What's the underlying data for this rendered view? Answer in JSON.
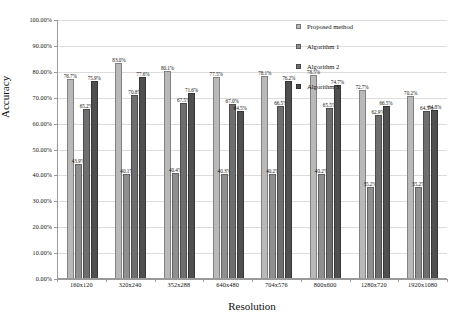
{
  "chart_data": {
    "type": "bar",
    "title": "",
    "xlabel": "Resolution",
    "ylabel": "Accuracy",
    "ylim": [
      0,
      100
    ],
    "ytick_labels": [
      "0.00%",
      "10.00%",
      "20.00%",
      "30.00%",
      "40.00%",
      "50.00%",
      "60.00%",
      "70.00%",
      "80.00%",
      "90.00%",
      "100.00%"
    ],
    "ytick_values": [
      0,
      10,
      20,
      30,
      40,
      50,
      60,
      70,
      80,
      90,
      100
    ],
    "grid": true,
    "legend_position": "top-right",
    "categories": [
      "160x120",
      "320x240",
      "352x288",
      "640x480",
      "704x576",
      "800x600",
      "1280x720",
      "1920x1080"
    ],
    "series": [
      {
        "name": "Proposed method",
        "color": "#b9b9b9",
        "values": [
          76.7,
          83.0,
          80.1,
          77.5,
          78.1,
          78.5,
          72.7,
          70.2
        ],
        "labels": [
          "76.7%",
          "83.0%",
          "80.1%",
          "77.5%",
          "78.1%",
          "78.5%",
          "72.7%",
          "70.2%"
        ]
      },
      {
        "name": "Algorithm 1",
        "color": "#8f8f8f",
        "values": [
          43.9,
          40.1,
          40.4,
          40.3,
          40.2,
          40.2,
          35.2,
          35.2
        ],
        "labels": [
          "43.9%",
          "40.1%",
          "40.4%",
          "40.3%",
          "40.2%",
          "40.2%",
          "35.2%",
          "35.2%"
        ]
      },
      {
        "name": "Algorithm 2",
        "color": "#6e6e6e",
        "values": [
          65.2,
          70.8,
          67.5,
          67.0,
          66.5,
          65.5,
          62.9,
          64.5
        ],
        "labels": [
          "65.2%",
          "70.8%",
          "67.5%",
          "67.0%",
          "66.5%",
          "65.5%",
          "62.9%",
          "64.5%"
        ]
      },
      {
        "name": "Algorithm 3",
        "color": "#4f4f4f",
        "values": [
          75.9,
          77.6,
          71.6,
          64.5,
          76.2,
          74.7,
          66.5,
          64.8
        ],
        "labels": [
          "75.9%",
          "77.6%",
          "71.6%",
          "64.5%",
          "76.2%",
          "74.7%",
          "66.5%",
          "64.8%"
        ]
      }
    ]
  },
  "axes": {
    "y_title": "Accuracy",
    "x_title": "Resolution"
  },
  "legend": {
    "items": [
      {
        "label": "Proposed method"
      },
      {
        "label": "Algorithm 1"
      },
      {
        "label": "Algorithm 2"
      },
      {
        "label": "Algorithm 3"
      }
    ]
  }
}
